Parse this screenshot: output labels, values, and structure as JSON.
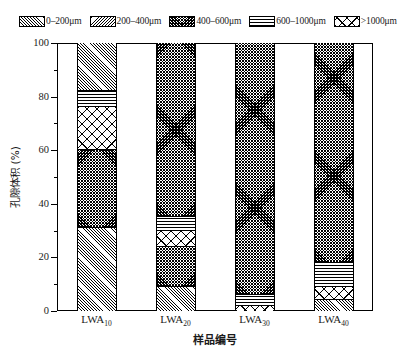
{
  "chart_data": {
    "type": "bar",
    "stacked": true,
    "title": "",
    "xlabel": "样品编号",
    "ylabel": "孔隙体积 (%)",
    "ylim": [
      0,
      100
    ],
    "yticks": [
      0,
      20,
      40,
      60,
      80,
      100
    ],
    "ytick_labels": [
      "0",
      "20",
      "40",
      "60",
      "80",
      "100"
    ],
    "yminor_step": 10,
    "grid": false,
    "legend_position": "top",
    "categories": [
      "LWA10",
      "LWA20",
      "LWA30",
      "LWA40"
    ],
    "category_labels": [
      {
        "base": "LWA",
        "sub": "10"
      },
      {
        "base": "LWA",
        "sub": "20"
      },
      {
        "base": "LWA",
        "sub": "30"
      },
      {
        "base": "LWA",
        "sub": "40"
      }
    ],
    "series": [
      {
        "name": "0–200μm",
        "pattern": "diagonal-forward-dense",
        "values": [
          49.0,
          9.0,
          2.0,
          7.0
        ]
      },
      {
        "name": "200–400μm",
        "pattern": "diagonal-back-dense",
        "values": [
          0.0,
          18.0,
          0.0,
          0.0
        ]
      },
      {
        "name": "400–600μm",
        "pattern": "crosshatch-dense",
        "values": [
          18.0,
          62.0,
          90.0,
          78.0
        ]
      },
      {
        "name": "600–1000μm",
        "pattern": "horizontal-lines",
        "values": [
          6.0,
          5.0,
          4.0,
          9.0
        ]
      },
      {
        "name": ">1000μm",
        "pattern": "zigzag-open",
        "values": [
          27.0,
          6.0,
          4.0,
          6.0
        ]
      }
    ],
    "stack_order_bottom_to_top": [
      "0–200μm",
      "200–400μm",
      "400–600μm",
      "600–1000μm",
      ">1000μm"
    ],
    "bars": [
      {
        "category": "LWA10",
        "segments": [
          {
            "series": "0–200μm",
            "from": 0.0,
            "to": 31.0
          },
          {
            "series": "400–600μm",
            "from": 31.0,
            "to": 60.0
          },
          {
            "series": ">1000μm",
            "from": 60.0,
            "to": 76.0
          },
          {
            "series": "600–1000μm",
            "from": 76.0,
            "to": 82.0
          },
          {
            "series": "0–200μm",
            "from": 82.0,
            "to": 100.0
          }
        ]
      },
      {
        "category": "LWA20",
        "segments": [
          {
            "series": "0–200μm",
            "from": 0.0,
            "to": 9.0
          },
          {
            "series": "400–600μm",
            "from": 9.0,
            "to": 24.0
          },
          {
            "series": ">1000μm",
            "from": 24.0,
            "to": 30.0
          },
          {
            "series": "600–1000μm",
            "from": 30.0,
            "to": 35.0
          },
          {
            "series": "400–600μm",
            "from": 35.0,
            "to": 100.0
          }
        ]
      },
      {
        "category": "LWA30",
        "segments": [
          {
            "series": ">1000μm",
            "from": 0.0,
            "to": 2.0
          },
          {
            "series": "600–1000μm",
            "from": 2.0,
            "to": 6.0
          },
          {
            "series": "400–600μm",
            "from": 6.0,
            "to": 100.0
          }
        ]
      },
      {
        "category": "LWA40",
        "segments": [
          {
            "series": "0–200μm",
            "from": 0.0,
            "to": 4.0
          },
          {
            "series": ">1000μm",
            "from": 4.0,
            "to": 9.0
          },
          {
            "series": "600–1000μm",
            "from": 9.0,
            "to": 18.0
          },
          {
            "series": "400–600μm",
            "from": 18.0,
            "to": 100.0
          }
        ]
      }
    ]
  },
  "legend": {
    "items": [
      {
        "label": "0–200μm",
        "pattern": "pat-a"
      },
      {
        "label": "200–400μm",
        "pattern": "pat-b"
      },
      {
        "label": "400–600μm",
        "pattern": "pat-c"
      },
      {
        "label": "600–1000μm",
        "pattern": "pat-d"
      },
      {
        "label": ">1000μm",
        "pattern": "pat-e"
      }
    ]
  },
  "axes": {
    "y_title": "孔隙体积 (%)",
    "x_title": "样品编号"
  },
  "colors": {
    "ink": "#000000",
    "background": "#ffffff"
  }
}
